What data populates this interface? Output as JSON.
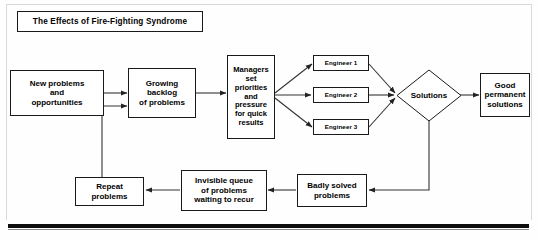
{
  "diagram": {
    "title": "The Effects of Fire-Fighting Syndrome",
    "type": "flowchart",
    "orientation": "left-to-right with feedback loop",
    "nodes": [
      {
        "id": "title",
        "label": "The Effects of Fire-Fighting Syndrome",
        "shape": "rectangle"
      },
      {
        "id": "new",
        "label": "New problems\nand\nopportunities",
        "shape": "rectangle"
      },
      {
        "id": "backlog",
        "label": "Growing\nbacklog\nof problems",
        "shape": "rectangle"
      },
      {
        "id": "managers",
        "label": "Managers\nset\npriorities\nand\npressure\nfor quick\nresults",
        "shape": "rectangle"
      },
      {
        "id": "eng1",
        "label": "Engineer 1",
        "shape": "rectangle"
      },
      {
        "id": "eng2",
        "label": "Engineer 2",
        "shape": "rectangle"
      },
      {
        "id": "eng3",
        "label": "Engineer 3",
        "shape": "rectangle"
      },
      {
        "id": "solutions",
        "label": "Solutions",
        "shape": "diamond"
      },
      {
        "id": "good",
        "label": "Good\npermanent\nsolutions",
        "shape": "rectangle"
      },
      {
        "id": "badly",
        "label": "Badly solved\nproblems",
        "shape": "rectangle"
      },
      {
        "id": "invisible",
        "label": "Invisible queue\nof problems\nwaiting to recur",
        "shape": "rectangle"
      },
      {
        "id": "repeat",
        "label": "Repeat\nproblems",
        "shape": "rectangle"
      }
    ],
    "edges": [
      {
        "from": "new",
        "to": "backlog"
      },
      {
        "from": "backlog",
        "to": "managers"
      },
      {
        "from": "managers",
        "to": "eng1"
      },
      {
        "from": "managers",
        "to": "eng2"
      },
      {
        "from": "managers",
        "to": "eng3"
      },
      {
        "from": "eng1",
        "to": "solutions"
      },
      {
        "from": "eng2",
        "to": "solutions"
      },
      {
        "from": "eng3",
        "to": "solutions"
      },
      {
        "from": "solutions",
        "to": "good"
      },
      {
        "from": "solutions",
        "to": "badly"
      },
      {
        "from": "badly",
        "to": "invisible"
      },
      {
        "from": "invisible",
        "to": "repeat"
      },
      {
        "from": "repeat",
        "to": "backlog"
      }
    ]
  },
  "labels": {
    "title": "The Effects of Fire-Fighting Syndrome",
    "new_problems_l1": "New problems",
    "new_problems_l2": "and",
    "new_problems_l3": "opportunities",
    "backlog_l1": "Growing",
    "backlog_l2": "backlog",
    "backlog_l3": "of problems",
    "managers_l1": "Managers",
    "managers_l2": "set",
    "managers_l3": "priorities",
    "managers_l4": "and",
    "managers_l5": "pressure",
    "managers_l6": "for quick",
    "managers_l7": "results",
    "engineer_1": "Engineer 1",
    "engineer_2": "Engineer 2",
    "engineer_3": "Engineer 3",
    "solutions": "Solutions",
    "good_l1": "Good",
    "good_l2": "permanent",
    "good_l3": "solutions",
    "badly_l1": "Badly solved",
    "badly_l2": "problems",
    "invisible_l1": "Invisible queue",
    "invisible_l2": "of problems",
    "invisible_l3": "waiting to recur",
    "repeat_l1": "Repeat",
    "repeat_l2": "problems"
  },
  "colors": {
    "page_background": "#fefefe",
    "node_fill": "#ffffff",
    "node_border": "#1a1a1a",
    "text": "#000000",
    "connector": "#333333",
    "frame_rule": "#d9d9d9",
    "bottom_rule": "#0d0d0d"
  }
}
